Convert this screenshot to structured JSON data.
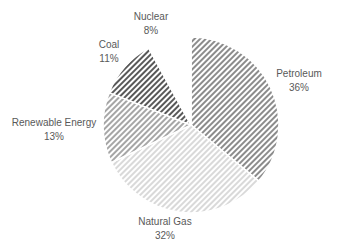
{
  "chart_data": {
    "type": "pie",
    "title": "",
    "start_angle_from_top_clockwise": true,
    "slices": [
      {
        "label": "Petroleum",
        "value": 36,
        "display": "36%",
        "color": "#8c8c8c",
        "pattern": "hatch-diagonal"
      },
      {
        "label": "Natural Gas",
        "value": 32,
        "display": "32%",
        "color": "#d9d9d9",
        "pattern": "hatch-diagonal"
      },
      {
        "label": "Renewable Energy",
        "value": 13,
        "display": "13%",
        "color": "#a6a6a6",
        "pattern": "hatch-diagonal"
      },
      {
        "label": "Coal",
        "value": 11,
        "display": "11%",
        "color": "#595959",
        "pattern": "hatch-diagonal"
      },
      {
        "label": "Nuclear",
        "value": 8,
        "display": "8%",
        "color": "#ffffff",
        "pattern": "none"
      }
    ],
    "legend": "none",
    "data_labels": "outside"
  }
}
